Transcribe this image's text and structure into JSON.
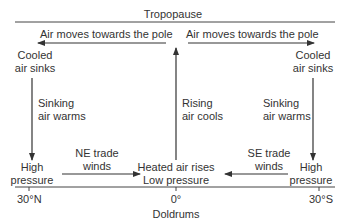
{
  "diagram": {
    "title": "Tropopause",
    "top_left_flow": "Air moves towards the pole",
    "top_right_flow": "Air moves towards the pole",
    "left_top": {
      "line1": "Cooled",
      "line2": "air sinks"
    },
    "right_top": {
      "line1": "Cooled",
      "line2": "air sinks"
    },
    "left_mid": {
      "line1": "Sinking",
      "line2": "air warms"
    },
    "right_mid": {
      "line1": "Sinking",
      "line2": "air warms"
    },
    "center_mid": {
      "line1": "Rising",
      "line2": "air cools"
    },
    "left_bottom": {
      "line1": "High",
      "line2": "pressure"
    },
    "right_bottom": {
      "line1": "High",
      "line2": "pressure"
    },
    "center_bottom": {
      "line1": "Heated air rises",
      "line2": "Low pressure"
    },
    "left_winds": {
      "line1": "NE trade",
      "line2": "winds"
    },
    "right_winds": {
      "line1": "SE trade",
      "line2": "winds"
    },
    "axis": {
      "left": "30°N",
      "center": "0°",
      "right": "30°S",
      "caption": "Doldrums"
    },
    "colors": {
      "line": "#333333",
      "text": "#333333",
      "background": "#ffffff"
    }
  }
}
